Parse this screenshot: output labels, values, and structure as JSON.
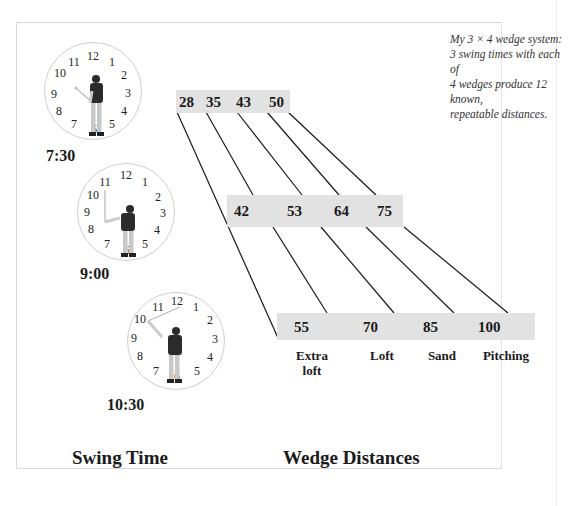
{
  "caption": {
    "line1": "My 3 × 4 wedge system:",
    "line2": "3 swing times with each of",
    "line3": "4 wedges produce 12 known,",
    "line4": "repeatable distances."
  },
  "clock_numbers": [
    "12",
    "1",
    "2",
    "3",
    "4",
    "5",
    "6",
    "7",
    "8",
    "9",
    "10",
    "11"
  ],
  "swing_times": [
    {
      "label": "7:30",
      "distances": [
        "28",
        "35",
        "43",
        "50"
      ]
    },
    {
      "label": "9:00",
      "distances": [
        "42",
        "53",
        "64",
        "75"
      ]
    },
    {
      "label": "10:30",
      "distances": [
        "55",
        "70",
        "85",
        "100"
      ]
    }
  ],
  "wedges": [
    {
      "label_line1": "Extra",
      "label_line2": "loft"
    },
    {
      "label_line1": "Loft",
      "label_line2": ""
    },
    {
      "label_line1": "Sand",
      "label_line2": ""
    },
    {
      "label_line1": "Pitching",
      "label_line2": ""
    }
  ],
  "titles": {
    "swing_time": "Swing Time",
    "wedge_distances": "Wedge Distances"
  },
  "colors": {
    "box_fill": "#e2e2e2",
    "line": "#1a1a1a"
  }
}
